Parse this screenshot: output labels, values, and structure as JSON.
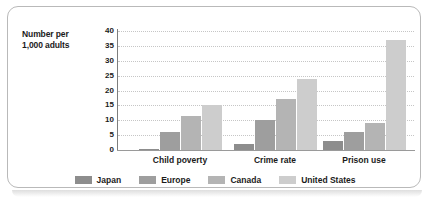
{
  "chart_data": {
    "type": "bar",
    "title": "",
    "xlabel": "",
    "ylabel": "Number per 1,000 adults",
    "ylabel_lines": [
      "Number per",
      "1,000 adults"
    ],
    "categories": [
      "Child poverty",
      "Crime rate",
      "Prison use"
    ],
    "series": [
      {
        "name": "Japan",
        "color": "#8d8d8d",
        "values": [
          0.4,
          2,
          3
        ]
      },
      {
        "name": "Europe",
        "color": "#9e9e9e",
        "values": [
          6,
          10,
          6
        ]
      },
      {
        "name": "Canada",
        "color": "#b4b4b4",
        "values": [
          11.5,
          17,
          9
        ]
      },
      {
        "name": "United States",
        "color": "#cdcdcd",
        "values": [
          15,
          24,
          37
        ]
      }
    ],
    "ylim": [
      0,
      40
    ],
    "yticks": [
      0,
      5,
      10,
      15,
      20,
      25,
      30,
      35,
      40
    ],
    "ytick_labels": [
      "0",
      "5",
      "10",
      "15",
      "20",
      "25",
      "30",
      "35",
      "40"
    ],
    "grid": true,
    "legend_position": "bottom"
  },
  "colors": {
    "frame_border": "#b9b9b9",
    "axis": "#7d7d7d",
    "gridline": "#c6c6c6",
    "text": "#1b1b1b",
    "plot_background": "#ffffff"
  }
}
